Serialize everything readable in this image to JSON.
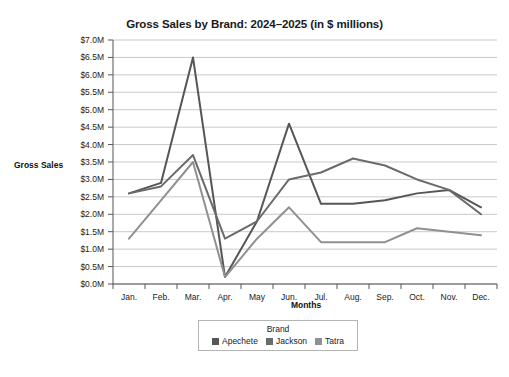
{
  "chart_data": {
    "type": "line",
    "title": "Gross Sales by Brand: 2024–2025 (in $ millions)",
    "xlabel": "Months",
    "ylabel": "Gross Sales",
    "categories": [
      "Jan.",
      "Feb.",
      "Mar.",
      "Apr.",
      "May",
      "Jun.",
      "Jul.",
      "Aug.",
      "Sep.",
      "Oct.",
      "Nov.",
      "Dec."
    ],
    "ytick_labels": [
      "$0.0M",
      "$0.5M",
      "$1.0M",
      "$1.5M",
      "$2.0M",
      "$2.5M",
      "$3.0M",
      "$3.5M",
      "$4.0M",
      "$4.5M",
      "$5.0M",
      "$5.5M",
      "$6.0M",
      "$6.5M",
      "$7.0M"
    ],
    "ytick_values": [
      0.0,
      0.5,
      1.0,
      1.5,
      2.0,
      2.5,
      3.0,
      3.5,
      4.0,
      4.5,
      5.0,
      5.5,
      6.0,
      6.5,
      7.0
    ],
    "ylim": [
      0.0,
      7.0
    ],
    "grid": true,
    "legend_position": "bottom",
    "legend_title": "Brand",
    "series": [
      {
        "name": "Apechete",
        "color": "#565656",
        "values": [
          2.6,
          2.9,
          6.5,
          0.2,
          1.8,
          4.6,
          2.3,
          2.3,
          2.4,
          2.6,
          2.7,
          2.2
        ]
      },
      {
        "name": "Jackson",
        "color": "#6b6b6b",
        "values": [
          2.6,
          2.8,
          3.7,
          1.3,
          1.8,
          3.0,
          3.2,
          3.6,
          3.4,
          3.0,
          2.7,
          2.0
        ]
      },
      {
        "name": "Tatra",
        "color": "#909090",
        "values": [
          1.3,
          2.4,
          3.5,
          0.2,
          1.3,
          2.2,
          1.2,
          1.2,
          1.2,
          1.6,
          1.5,
          1.4
        ]
      }
    ]
  },
  "legend": {
    "title": "Brand",
    "items": [
      {
        "label": "Apechete",
        "color": "#565656"
      },
      {
        "label": "Jackson",
        "color": "#6b6b6b"
      },
      {
        "label": "Tatra",
        "color": "#909090"
      }
    ]
  },
  "axes": {
    "y_axis_title": "Gross Sales",
    "x_axis_title": "Months"
  }
}
